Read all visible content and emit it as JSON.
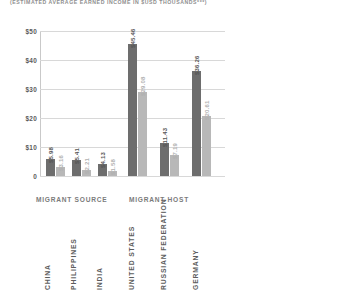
{
  "header": {
    "subtitle": "(ESTIMATED AVERAGE EARNED INCOME IN $USD THOUSANDS***)"
  },
  "chart_data": {
    "type": "bar",
    "title": "",
    "subtitle": "(ESTIMATED AVERAGE EARNED INCOME IN $USD THOUSANDS***)",
    "xlabel": "",
    "ylabel": "",
    "ylim": [
      0,
      50
    ],
    "grid": true,
    "legend": "none",
    "y_ticks": [
      "0",
      "$10",
      "$20",
      "$30",
      "$40",
      "$50"
    ],
    "y_tick_values": [
      0,
      10,
      20,
      30,
      40,
      50
    ],
    "groups": [
      {
        "name": "MIGRANT SOURCE",
        "categories": [
          "CHINA",
          "PHILIPPINES",
          "INDIA"
        ]
      },
      {
        "name": "MIGRANT HOST",
        "categories": [
          "UNITED STATES",
          "RUSSIAN FEDERATION",
          "GERMANY"
        ]
      }
    ],
    "categories": [
      "CHINA",
      "PHILIPPINES",
      "INDIA",
      "UNITED STATES",
      "RUSSIAN FEDERATION",
      "GERMANY"
    ],
    "series": [
      {
        "name": "primary",
        "color": "#6d6d6d",
        "values": [
          5.98,
          5.41,
          4.13,
          45.46,
          11.43,
          36.26
        ],
        "labels": [
          "$5.98",
          "$5.41",
          "$4.13",
          "$45.46",
          "$11.43",
          "$36.26"
        ]
      },
      {
        "name": "secondary",
        "color": "#b8b8b8",
        "values": [
          3.16,
          2.21,
          1.58,
          29.08,
          7.19,
          20.61
        ],
        "labels": [
          "$3.16",
          "$2.21",
          "$1.58",
          "$29.08",
          "$7.19",
          "$20.61"
        ]
      }
    ]
  }
}
